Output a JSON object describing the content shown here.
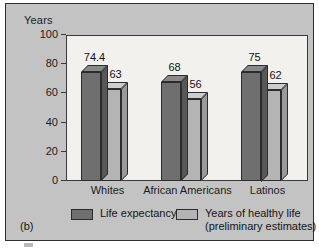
{
  "figure": {
    "caption": "(b)",
    "axis_caption": "Years"
  },
  "chart_data": {
    "type": "bar",
    "title": "",
    "subtitle": "",
    "xlabel": "",
    "ylabel": "Years",
    "ylim": [
      0,
      100
    ],
    "yticks": [
      0,
      20,
      40,
      60,
      80,
      100
    ],
    "ytick_labels": [
      "0",
      "20",
      "40",
      "60",
      "80",
      "100"
    ],
    "grid": false,
    "legend_position": "bottom",
    "categories": [
      "Whites",
      "African Americans",
      "Latinos"
    ],
    "series": [
      {
        "name": "Life expectancy",
        "color": "#6f6f6f",
        "values": [
          74.4,
          68,
          75
        ],
        "value_labels": [
          "74.4",
          "68",
          "75"
        ]
      },
      {
        "name": "Years of healthy life (preliminary estimates)",
        "color": "#b4b4b4",
        "values": [
          63,
          56,
          62
        ],
        "value_labels": [
          "63",
          "56",
          "62"
        ]
      }
    ]
  },
  "legend": {
    "items": [
      {
        "label": "Life expectancy",
        "label_line2": "",
        "color": "#6f6f6f"
      },
      {
        "label": "Years of healthy life",
        "label_line2": "(preliminary estimates)",
        "color": "#b4b4b4"
      }
    ]
  },
  "colors": {
    "panel_background": "#c3c3c3",
    "plot_background": "#f2f1ee",
    "frame": "#3a3a3a",
    "series_dark": "#6f6f6f",
    "series_light": "#b4b4b4",
    "text": "#1c1c1c"
  }
}
